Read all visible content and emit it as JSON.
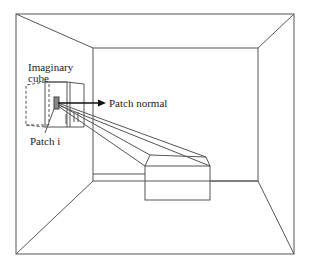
{
  "diagram": {
    "type": "radiosity hemicube illustration",
    "labels": {
      "imaginary_cube_line1": "Imaginary",
      "imaginary_cube_line2": "cube",
      "patch_normal": "Patch normal",
      "patch_i": "Patch i"
    },
    "colors": {
      "stroke": "#555555",
      "text": "#222222",
      "background": "#ffffff"
    }
  }
}
